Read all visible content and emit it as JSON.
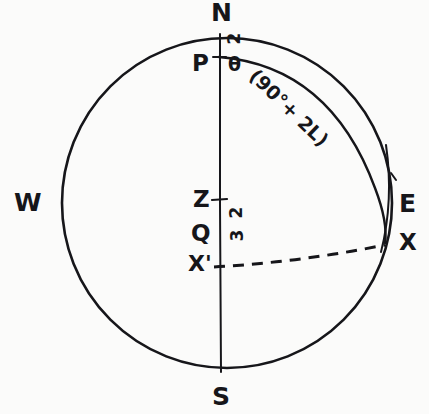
{
  "figure": {
    "background_color": "#fbfbfa",
    "ink_color": "#16161a"
  },
  "cardinal_points": [
    {
      "key": "north",
      "label": "N",
      "x": 219,
      "y": 2
    },
    {
      "key": "south",
      "label": "S",
      "x": 220,
      "y": 385
    },
    {
      "key": "west",
      "label": "W",
      "x": 14,
      "y": 188
    },
    {
      "key": "east",
      "label": "E",
      "x": 398,
      "y": 192
    }
  ],
  "points": [
    {
      "key": "pole",
      "label": "P",
      "x": 192,
      "y": 53
    },
    {
      "key": "zenith",
      "label": "Z",
      "x": 192,
      "y": 190
    },
    {
      "key": "equator-q",
      "label": "Q",
      "x": 190,
      "y": 226
    },
    {
      "key": "x-prime",
      "label": "X'",
      "x": 188,
      "y": 256
    },
    {
      "key": "x-on-horizon",
      "label": "X",
      "x": 398,
      "y": 231
    }
  ],
  "annotations": {
    "theta": {
      "label": "θ",
      "x": 229,
      "y": 57
    },
    "arc_2_upper": {
      "label": "2",
      "x": 230,
      "y": 32
    },
    "arc_2_lower": {
      "label": "2",
      "x": 232,
      "y": 205
    },
    "arc_3": {
      "label": "3",
      "x": 232,
      "y": 228
    },
    "formula": {
      "label": "(90°+ 2L)",
      "x": 262,
      "y": 68,
      "rotation": 44
    }
  },
  "geometry": {
    "circle": {
      "cx": 227,
      "cy": 203,
      "r": 165
    },
    "meridian_line": {
      "x": 220,
      "y1": 34,
      "y2": 372
    },
    "declination_arc": "from P curving right and down to X",
    "horizon_arc_dashed": "from X' on the meridian rising slightly to X on the limb"
  },
  "legend_keys": {
    "N": "North point",
    "S": "South point",
    "E": "East point",
    "W": "West point",
    "P": "Celestial pole",
    "Z": "Zenith",
    "Q": "Equator point",
    "X": "Star on horizon",
    "X'": "Star projection on meridian"
  }
}
